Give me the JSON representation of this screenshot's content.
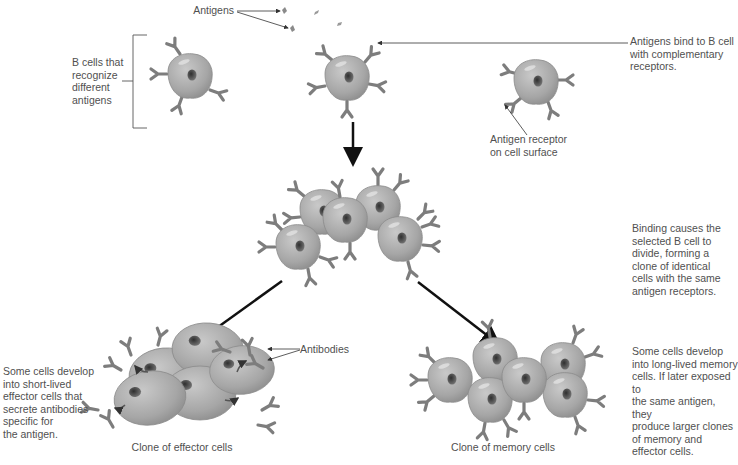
{
  "diagram": {
    "labels": {
      "antigens": "Antigens",
      "b_cells_recognize": [
        "B cells that",
        "recognize",
        "different",
        "antigens"
      ],
      "antigens_bind": [
        "Antigens bind to B cell",
        "with complementary",
        "receptors."
      ],
      "antigen_receptor": [
        "Antigen receptor",
        "on cell surface"
      ],
      "binding_causes": [
        "Binding causes the",
        "selected B cell to",
        "divide, forming a",
        "clone of identical",
        "cells with the same",
        "antigen receptors."
      ],
      "effector_desc": [
        "Some cells develop",
        "into short-lived",
        "effector cells that",
        "secrete antibodies",
        "specific for",
        "the antigen."
      ],
      "antibodies": "Antibodies",
      "clone_effector": "Clone of effector cells",
      "memory_desc": [
        "Some cells develop",
        "into long-lived memory",
        "cells. If later exposed to",
        "the same antigen, they",
        "produce larger clones",
        "of memory and",
        "effector cells."
      ],
      "clone_memory": "Clone of memory cells"
    },
    "colors": {
      "cell_fill": "#a8a8a8",
      "cell_stroke": "#8a8a8a",
      "nucleus": "#555555",
      "receptor": "#7d7d7d",
      "arrow": "#111111",
      "text": "#505050"
    }
  }
}
